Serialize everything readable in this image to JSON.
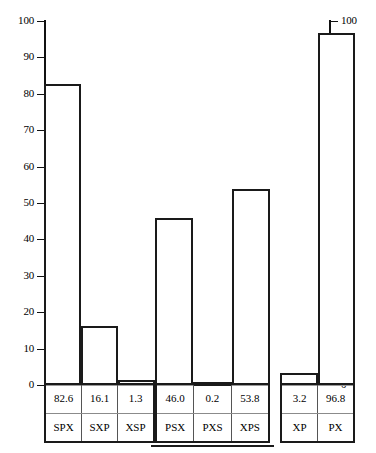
{
  "chart_data": {
    "type": "bar",
    "title": "",
    "xlabel": "",
    "ylabel": "",
    "ylim": [
      0,
      100
    ],
    "grid": false,
    "legend": "none",
    "y_ticks": [
      0,
      10,
      20,
      30,
      40,
      50,
      60,
      70,
      80,
      90,
      100
    ],
    "y_axis_left_labels": [
      "0",
      "10",
      "20",
      "30",
      "40",
      "50",
      "60",
      "70",
      "80",
      "90",
      "100"
    ],
    "y_axis_right_labels": [
      "0",
      "10",
      "20",
      "30",
      "40",
      "50",
      "60",
      "70",
      "80",
      "90",
      "100"
    ],
    "categories": [
      "SPX",
      "SXP",
      "XSP",
      "PSX",
      "PXS",
      "XPS",
      "XP",
      "PX"
    ],
    "values": [
      82.6,
      16.1,
      1.3,
      46.0,
      0.2,
      53.8,
      3.2,
      96.8
    ],
    "value_labels": [
      "82.6",
      "16.1",
      "1.3",
      "46.0",
      "0.2",
      "53.8",
      "3.2",
      "96.8"
    ],
    "groups": [
      {
        "id": "group-1",
        "bars": [
          {
            "label": "SPX",
            "value": 82.6,
            "value_label": "82.6"
          },
          {
            "label": "SXP",
            "value": 16.1,
            "value_label": "16.1"
          },
          {
            "label": "XSP",
            "value": 1.3,
            "value_label": "1.3"
          }
        ]
      },
      {
        "id": "group-2",
        "bars": [
          {
            "label": "PSX",
            "value": 46.0,
            "value_label": "46.0"
          },
          {
            "label": "PXS",
            "value": 0.2,
            "value_label": "0.2"
          },
          {
            "label": "XPS",
            "value": 53.8,
            "value_label": "53.8"
          }
        ]
      },
      {
        "id": "group-3",
        "bars": [
          {
            "label": "XP",
            "value": 3.2,
            "value_label": "3.2"
          },
          {
            "label": "PX",
            "value": 96.8,
            "value_label": "96.8"
          }
        ]
      }
    ]
  },
  "colors": {
    "bar_outline": "#1a1a1a",
    "bar_fill": "#ffffff",
    "axis": "#111111",
    "text": "#000000",
    "rule": "#9a9a9a",
    "background": "#ffffff"
  }
}
